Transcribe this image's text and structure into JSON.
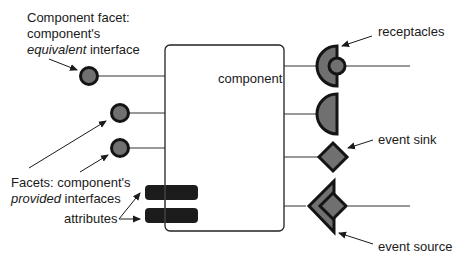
{
  "diagram": {
    "component_label": "component",
    "colors": {
      "fill": "#707070",
      "stroke": "#141414",
      "line": "#333333",
      "attribute": "#1c1c1c"
    },
    "labels": {
      "component_facet_line1": "Component facet:",
      "component_facet_line2": "component's",
      "component_facet_line3_italic": "equivalent",
      "component_facet_line3_rest": " interface",
      "facets_line1": "Facets: component's",
      "facets_line2_italic": "provided",
      "facets_line2_rest": " interfaces",
      "attributes": "attributes",
      "receptacles": "receptacles",
      "event_sink": "event sink",
      "event_source": "event source"
    }
  }
}
